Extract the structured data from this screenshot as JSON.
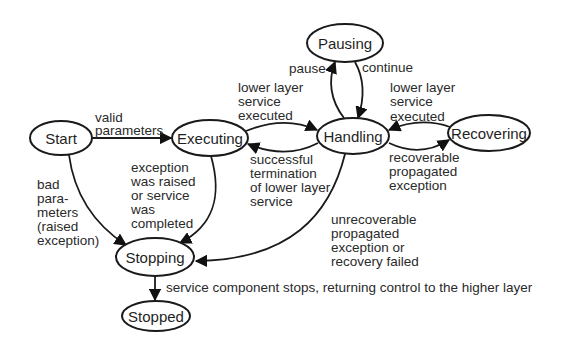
{
  "diagram": {
    "type": "state-transition-diagram",
    "nodes": [
      {
        "id": "start",
        "label": "Start",
        "cx": 61,
        "cy": 138,
        "rx": 31,
        "ry": 17
      },
      {
        "id": "executing",
        "label": "Executing",
        "cx": 210,
        "cy": 138,
        "rx": 38,
        "ry": 18
      },
      {
        "id": "pausing",
        "label": "Pausing",
        "cx": 345,
        "cy": 43,
        "rx": 38,
        "ry": 19
      },
      {
        "id": "handling",
        "label": "Handling",
        "cx": 353,
        "cy": 136,
        "rx": 36,
        "ry": 18
      },
      {
        "id": "recovering",
        "label": "Recovering",
        "cx": 489,
        "cy": 133,
        "rx": 41,
        "ry": 18
      },
      {
        "id": "stopping",
        "label": "Stopping",
        "cx": 155,
        "cy": 257,
        "rx": 39,
        "ry": 19
      },
      {
        "id": "stopped",
        "label": "Stopped",
        "cx": 156,
        "cy": 316,
        "rx": 34,
        "ry": 15
      }
    ],
    "edges": [
      {
        "id": "start-executing",
        "from": "Start",
        "to": "Executing",
        "label_lines": [
          "valid",
          "parameters"
        ]
      },
      {
        "id": "start-stopping",
        "from": "Start",
        "to": "Stopping",
        "label_lines": [
          "bad",
          "para-",
          "meters",
          "(raised",
          "exception)"
        ]
      },
      {
        "id": "executing-handling",
        "from": "Executing",
        "to": "Handling",
        "label_lines": [
          "lower layer",
          "service",
          "executed"
        ]
      },
      {
        "id": "handling-executing",
        "from": "Handling",
        "to": "Executing",
        "label_lines": [
          "successful",
          "termination",
          "of lower layer",
          "service"
        ]
      },
      {
        "id": "executing-stopping",
        "from": "Executing",
        "to": "Stopping",
        "label_lines": [
          "exception",
          "was raised",
          "or service",
          "was",
          "completed"
        ]
      },
      {
        "id": "handling-pausing",
        "from": "Handling",
        "to": "Pausing",
        "label_lines": [
          "pause"
        ]
      },
      {
        "id": "pausing-handling",
        "from": "Pausing",
        "to": "Handling",
        "label_lines": [
          "continue"
        ]
      },
      {
        "id": "recovering-handling",
        "from": "Recovering",
        "to": "Handling",
        "label_lines": [
          "lower layer",
          "service",
          "executed"
        ]
      },
      {
        "id": "handling-recovering",
        "from": "Handling",
        "to": "Recovering",
        "label_lines": [
          "recoverable",
          "propagated",
          "exception"
        ]
      },
      {
        "id": "handling-stopping",
        "from": "Handling",
        "to": "Stopping",
        "label_lines": [
          "unrecoverable",
          "propagated",
          "exception or",
          "recovery failed"
        ]
      },
      {
        "id": "stopping-stopped",
        "from": "Stopping",
        "to": "Stopped",
        "label_lines": [
          "service component stops, returning control to the higher layer"
        ]
      }
    ]
  }
}
